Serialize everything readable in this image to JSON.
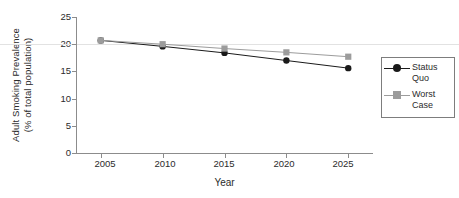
{
  "chart_data": {
    "type": "line",
    "title": "",
    "xlabel": "Year",
    "ylabel_line1": "Adult Smoking Prevalence",
    "ylabel_line2": "(% of total population)",
    "x": [
      2005,
      2010,
      2015,
      2020,
      2025
    ],
    "xticklabels": [
      "2005",
      "2010",
      "2015",
      "2020",
      "2025"
    ],
    "yticklabels": [
      "0",
      "5",
      "10",
      "15",
      "20",
      "25"
    ],
    "yticks": [
      0,
      5,
      10,
      15,
      20,
      25
    ],
    "ylim": [
      0,
      25
    ],
    "xlim": [
      2003,
      2027
    ],
    "grid": "horizontal-at-20-only",
    "legend_position": "right-outside",
    "series": [
      {
        "name": "Status Quo",
        "name_line1": "Status",
        "name_line2": "Quo",
        "marker": "circle",
        "color": "#1a1a1a",
        "values": [
          20.7,
          19.6,
          18.4,
          17.0,
          15.6
        ]
      },
      {
        "name": "Worst Case",
        "name_line1": "Worst",
        "name_line2": "Case",
        "marker": "square",
        "color": "#9c9c9c",
        "values": [
          20.7,
          20.0,
          19.2,
          18.5,
          17.7
        ]
      }
    ]
  },
  "colors": {
    "axis": "#8c8c8c",
    "gridline": "#e2e2e2",
    "text": "#2b2b2b",
    "legend_border": "#7d7d7d",
    "background": "#ffffff"
  }
}
